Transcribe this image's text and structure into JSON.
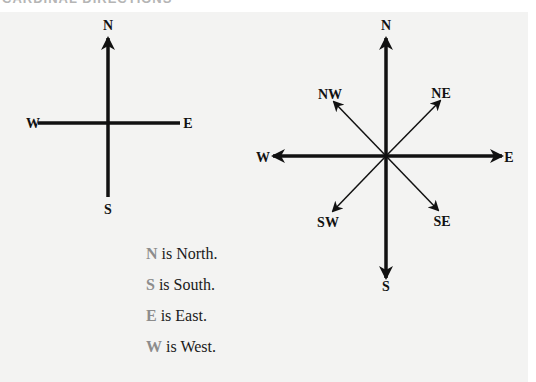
{
  "title": "CARDINAL DIRECTIONS",
  "colors": {
    "panel_background": "#f3f3f2",
    "line": "#111111",
    "legend_key": "#8c8c8c"
  },
  "simple_compass": {
    "labels": {
      "north": "N",
      "south": "S",
      "east": "E",
      "west": "W"
    }
  },
  "full_compass": {
    "labels": {
      "north": "N",
      "south": "S",
      "east": "E",
      "west": "W",
      "northwest": "NW",
      "northeast": "NE",
      "southwest": "SW",
      "southeast": "SE"
    }
  },
  "legend": [
    {
      "key": "N",
      "text": " is North."
    },
    {
      "key": "S",
      "text": " is South."
    },
    {
      "key": "E",
      "text": " is East."
    },
    {
      "key": "W",
      "text": " is West."
    }
  ]
}
